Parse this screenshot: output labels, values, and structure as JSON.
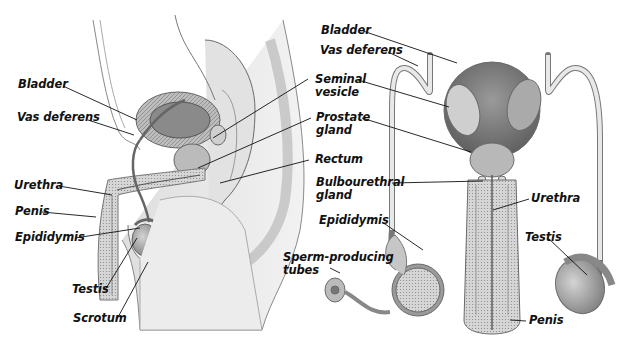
{
  "diagram": {
    "views": [
      {
        "name": "side-view",
        "labels": [
          "Bladder",
          "Vas deferens",
          "Urethra",
          "Penis",
          "Epididymis",
          "Testis",
          "Scrotum"
        ]
      },
      {
        "name": "front-view",
        "labels": [
          "Bladder",
          "Vas deferens",
          "Seminal vesicle",
          "Prostate gland",
          "Rectum",
          "Bulbourethral gland",
          "Epididymis",
          "Sperm-producing tubes",
          "Urethra",
          "Testis",
          "Penis"
        ]
      }
    ]
  },
  "labels": {
    "left": {
      "bladder": "Bladder",
      "vas_deferens": "Vas deferens",
      "urethra": "Urethra",
      "penis": "Penis",
      "epididymis": "Epididymis",
      "testis": "Testis",
      "scrotum": "Scrotum"
    },
    "center": {
      "seminal_vesicle": "Seminal\nvesicle",
      "prostate_gland": "Prostate\ngland",
      "rectum": "Rectum",
      "bulbourethral_gland": "Bulbourethral\ngland",
      "epididymis": "Epididymis",
      "sperm_producing_tubes": "Sperm-producing\ntubes"
    },
    "right": {
      "bladder": "Bladder",
      "vas_deferens": "Vas deferens",
      "urethra": "Urethra",
      "testis": "Testis",
      "penis": "Penis"
    }
  },
  "colors": {
    "tissue_light": "#e9e9e9",
    "tissue_mid": "#c8c8c8",
    "tissue_dark": "#8a8a8a",
    "outline": "#6a6a6a",
    "leader": "#111111",
    "text": "#111111"
  }
}
